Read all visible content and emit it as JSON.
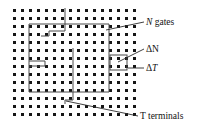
{
  "figure": {
    "background_color": "#ffffff",
    "dot_color": "#151515",
    "outline_color": "#4a4a4a",
    "leader_color": "#2b2b2b",
    "width": 199,
    "height": 131
  },
  "grid": {
    "description": "square array of dark square dots",
    "columns": 16,
    "rows": 14,
    "x_start": 13,
    "y_start": 9,
    "spacing_x": 8,
    "spacing_y": 8,
    "dot_size": 3
  },
  "labels": {
    "n_gates": {
      "symbol": "N",
      "text": " gates",
      "full": "N gates",
      "x": 146,
      "y": 25
    },
    "delta_n": {
      "full": "ΔN",
      "x": 146,
      "y": 52
    },
    "delta_t": {
      "symbol_prefix": "Δ",
      "symbol": "T",
      "full": "ΔT",
      "x": 146,
      "y": 71
    },
    "t_terminals": {
      "symbol": "T",
      "text": " terminals",
      "full": "T terminals",
      "x": 140,
      "y": 119
    }
  },
  "shapes": {
    "gate_region_outline": "M 29,24 L 29,92 L 109,92 L 109,24 Z",
    "inner_step_upper": "M 41,36 L 49,36 L 49,31 L 65,31 L 65,8",
    "inner_step_left": "M 29,66 L 45,66 L 45,61 L 29,61",
    "inner_vertical_mid": "M 73,48 L 73,100 L 65,100 L 65,104",
    "marker_box": {
      "x": 110,
      "y": 55,
      "width": 17,
      "height": 15
    }
  },
  "leaders": {
    "n_gates_line": "M 144,22 L 106,30",
    "delta_n_line": "M 144,49 L 118,62",
    "delta_t_line": "M 144,68 L 128,68",
    "t_terminals_line": "M 138,116 L 66,101"
  }
}
